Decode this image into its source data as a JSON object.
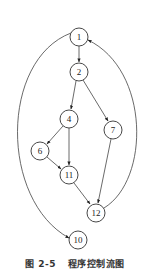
{
  "diagram": {
    "type": "control-flow-graph",
    "nodes": [
      {
        "id": "1",
        "label": "1",
        "x": 79,
        "y": 37
      },
      {
        "id": "2",
        "label": "2",
        "x": 79,
        "y": 72
      },
      {
        "id": "4",
        "label": "4",
        "x": 69,
        "y": 119
      },
      {
        "id": "7",
        "label": "7",
        "x": 113,
        "y": 130
      },
      {
        "id": "6",
        "label": "6",
        "x": 40,
        "y": 151
      },
      {
        "id": "11",
        "label": "11",
        "x": 69,
        "y": 175
      },
      {
        "id": "12",
        "label": "12",
        "x": 96,
        "y": 213
      },
      {
        "id": "10",
        "label": "10",
        "x": 78,
        "y": 240
      }
    ],
    "edges": [
      {
        "from": "1",
        "to": "2"
      },
      {
        "from": "2",
        "to": "4"
      },
      {
        "from": "2",
        "to": "7"
      },
      {
        "from": "4",
        "to": "6"
      },
      {
        "from": "4",
        "to": "11"
      },
      {
        "from": "6",
        "to": "11"
      },
      {
        "from": "11",
        "to": "12"
      },
      {
        "from": "7",
        "to": "12"
      },
      {
        "from": "12",
        "to": "1",
        "curved": true
      },
      {
        "from": "1",
        "to": "10",
        "curved": true
      }
    ]
  },
  "caption": {
    "figure_number": "图 2-5",
    "title": "程序控制流图"
  }
}
